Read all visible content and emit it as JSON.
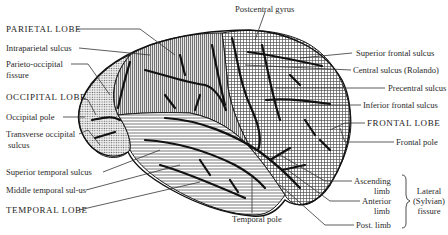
{
  "diagram": {
    "regions": [
      {
        "name": "parietal-lobe",
        "pattern": "vertical-lines"
      },
      {
        "name": "occipital-lobe",
        "pattern": "dots"
      },
      {
        "name": "temporal-lobe",
        "pattern": "horizontal-lines"
      },
      {
        "name": "frontal-lobe",
        "pattern": "crosshatch"
      }
    ],
    "labels_left": {
      "parietal_lobe": "PARIETAL LOBE",
      "intraparietal_sulcus": "Intraparietal sulcus",
      "parieto_occipital_1": "Parieto-occipital",
      "parieto_occipital_2": "fissure",
      "occipital_lobe": "OCCIPITAL LOBE",
      "occipital_pole": "Occipital pole",
      "transverse_occipital_1": "Transverse occipital",
      "transverse_occipital_2": "sulcus",
      "superior_temporal_sulcus": "Superior temporal sulcus",
      "middle_temporal_sulcus": "Middle temporal sul-us",
      "temporal_lobe": "TEMPORAL LOBE"
    },
    "labels_top": {
      "postcentral_gyrus": "Postcentral gyrus"
    },
    "labels_bottom": {
      "temporal_pole": "Temporal pole"
    },
    "labels_right": {
      "superior_frontal_sulcus": "Superior frontal sulcus",
      "central_sulcus": "Central sulcus (Rolando)",
      "precentral_sulcus": "Precentral sulcus",
      "inferior_frontal_sulcus": "Inferior frontal sulcus",
      "frontal_lobe": "FRONTAL LOBE",
      "frontal_pole": "Frontal pole",
      "ascending_limb_1": "Ascending",
      "ascending_limb_2": "limb",
      "anterior_limb_1": "Anterior",
      "anterior_limb_2": "limb",
      "post_limb": "Post. limb",
      "lateral_fissure_1": "Lateral",
      "lateral_fissure_2": "(Sylvian)",
      "lateral_fissure_3": "fissure"
    },
    "colors": {
      "ink": "#1a1a1a",
      "fill_light": "#d9d9d9",
      "background": "#ffffff"
    }
  }
}
